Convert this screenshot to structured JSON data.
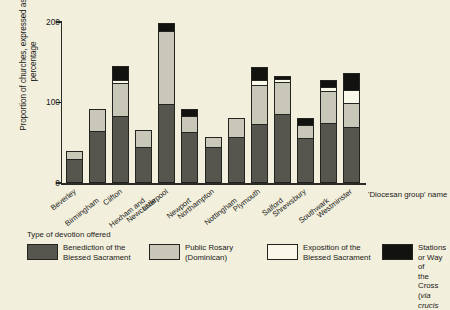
{
  "chart_data": {
    "type": "bar",
    "subtype": "stacked-bar",
    "title": "",
    "xlabel": "'Diocesan group' name",
    "ylabel": "Proportion of churches, expressed as a percentage",
    "ylim": [
      0,
      200
    ],
    "yticks": [
      0,
      100,
      200
    ],
    "ytick_labels": [
      "0",
      "100",
      "200"
    ],
    "grid": false,
    "legend_position": "bottom",
    "legend_title": "Type of devotion offered",
    "categories": [
      "Beverley",
      "Birmingham",
      "Clifton",
      "Hexham and Newcastle",
      "Liverpool",
      "Newport",
      "Northampton",
      "Nottingham",
      "Plymouth",
      "Salford",
      "Shrewsbury",
      "Southwark",
      "Westminster"
    ],
    "series": [
      {
        "name": "Benediction of the Blessed Sacrament",
        "color": "#57564e",
        "values": [
          28,
          63,
          82,
          43,
          97,
          62,
          44,
          56,
          72,
          84,
          55,
          73,
          68
        ]
      },
      {
        "name": "Public Rosary (Dominican)",
        "color": "#c9c7b8",
        "values": [
          10,
          28,
          41,
          22,
          91,
          20,
          12,
          23,
          48,
          40,
          16,
          40,
          30
        ]
      },
      {
        "name": "Exposition of the Blessed Sacrament",
        "color": "#faf8e9",
        "values": [
          0,
          0,
          4,
          0,
          0,
          0,
          0,
          0,
          7,
          4,
          0,
          5,
          16
        ]
      },
      {
        "name": "Stations or Way of the Cross (via crucis)",
        "color": "#121210",
        "values": [
          0,
          0,
          17,
          0,
          9,
          9,
          0,
          0,
          16,
          4,
          9,
          8,
          21
        ]
      }
    ]
  },
  "axis": {
    "x_title": "'Diocesan group' name"
  },
  "legend": {
    "title": "Type of devotion offered",
    "items": [
      {
        "label": "Benediction of the\nBlessed Sacrament",
        "swatch": "benediction"
      },
      {
        "label": "Public Rosary\n(Dominican)",
        "swatch": "rosary"
      },
      {
        "label": "Exposition of the\nBlessed Sacrament",
        "swatch": "exposition"
      },
      {
        "label": "Stations or Way of\nthe Cross (via crucis",
        "swatch": "stations"
      }
    ]
  }
}
